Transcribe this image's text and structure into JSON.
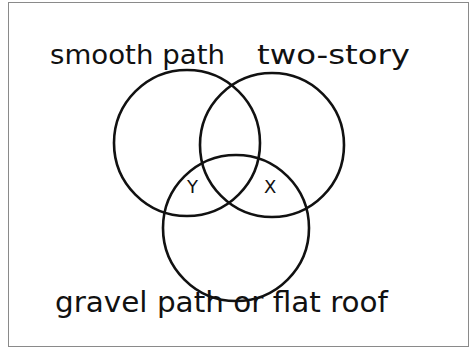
{
  "diagram": {
    "type": "venn",
    "sets": [
      {
        "label": "smooth path"
      },
      {
        "label": "two-story"
      },
      {
        "label": "gravel path or flat roof"
      }
    ],
    "region_labels": [
      {
        "label": "Y",
        "region": "smooth path ∩ gravel path or flat roof (not two-story)"
      },
      {
        "label": "X",
        "region": "two-story ∩ gravel path or flat roof (not smooth path)"
      }
    ],
    "colors": {
      "stroke": "#111111",
      "frame": "#8a8a8a",
      "background": "#ffffff"
    }
  }
}
